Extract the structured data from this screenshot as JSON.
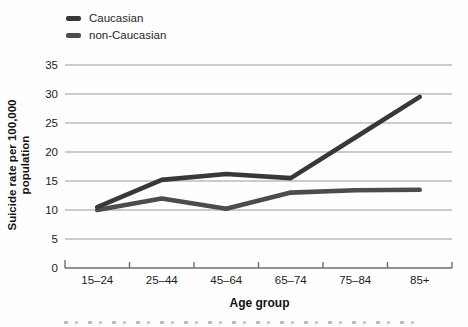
{
  "chart_data": {
    "type": "line",
    "categories": [
      "15–24",
      "25–44",
      "45–64",
      "65–74",
      "75–84",
      "85+"
    ],
    "series": [
      {
        "name": "Caucasian",
        "color": "#383838",
        "values": [
          10.5,
          15.2,
          16.2,
          15.5,
          22.5,
          29.5
        ]
      },
      {
        "name": "non-Caucasian",
        "color": "#4c4c4c",
        "values": [
          10.0,
          12.0,
          10.2,
          13.0,
          13.4,
          13.5
        ]
      }
    ],
    "title": "",
    "xlabel": "Age group",
    "ylabel": "Suicide rate per 100,000 population",
    "ylabel_lines": [
      "Suicide rate per 100,000",
      "population"
    ],
    "yticks": [
      0,
      5,
      10,
      15,
      20,
      25,
      30,
      35
    ],
    "ylim": [
      0,
      35
    ],
    "grid": "horizontal",
    "legend_position": "top-left"
  },
  "colors": {
    "background": "#fefefe",
    "gridline": "#9a9a9a",
    "axis": "#6e6e6e",
    "text": "#1c1c1c"
  }
}
